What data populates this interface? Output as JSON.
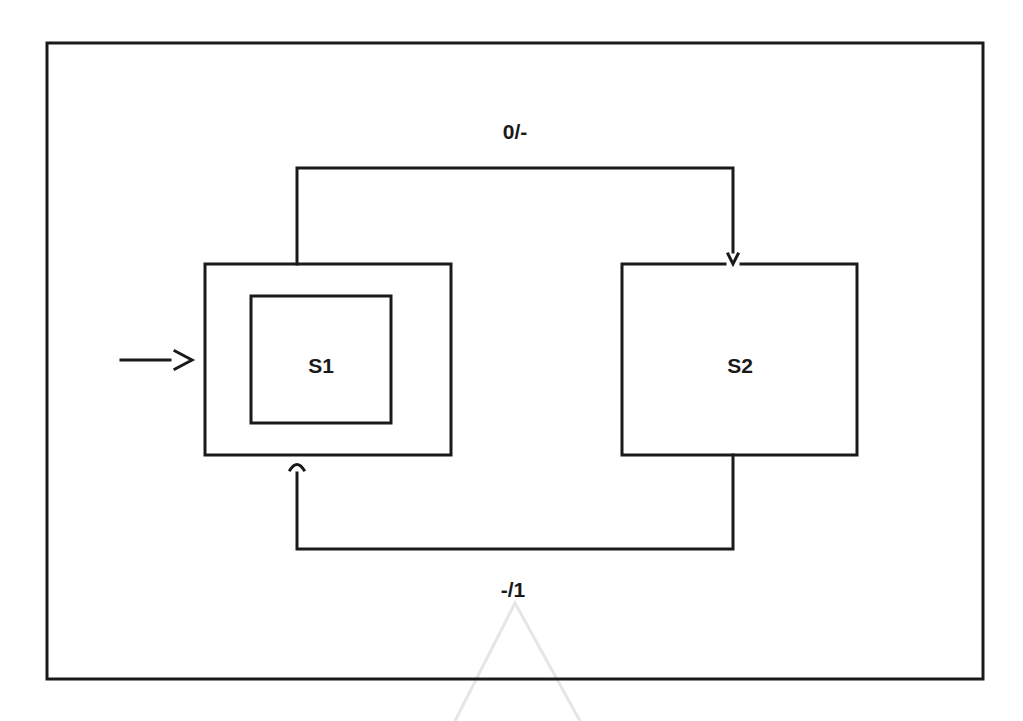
{
  "diagram": {
    "type": "state-machine",
    "states": [
      {
        "id": "S1",
        "label": "S1",
        "initial": true
      },
      {
        "id": "S2",
        "label": "S2",
        "initial": false
      }
    ],
    "transitions": [
      {
        "from": "S1",
        "to": "S2",
        "label": "0/-"
      },
      {
        "from": "S2",
        "to": "S1",
        "label": "-/1"
      }
    ],
    "initial_arrow_glyph": "—>"
  },
  "colors": {
    "stroke": "#1a1a1a",
    "background": "#ffffff"
  }
}
